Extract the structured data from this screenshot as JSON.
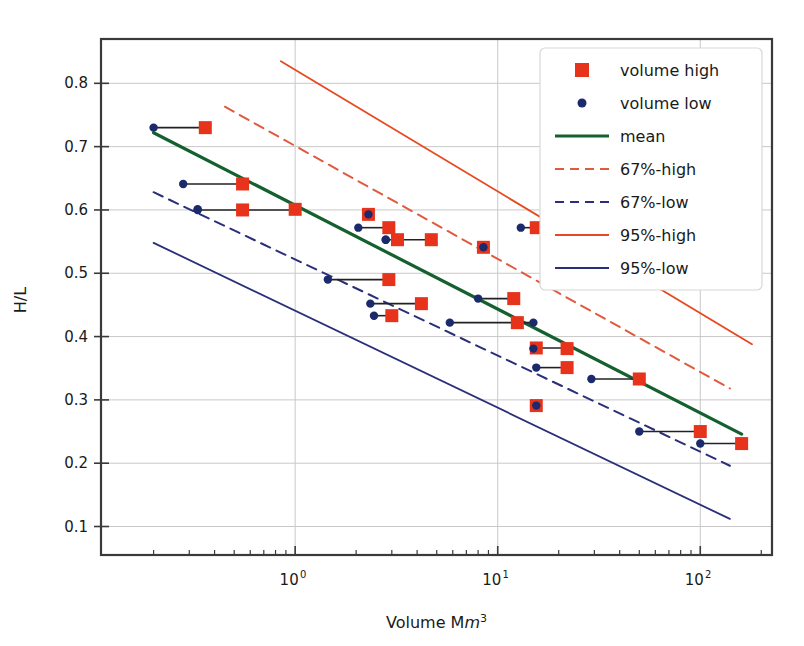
{
  "figure": {
    "title": "",
    "y_axis_label": "H/L",
    "x_axis_label_parts": {
      "prefix": "Volume M",
      "italic": "m",
      "superscript": "3"
    },
    "x_tick_labels": [
      "10",
      "10",
      "10"
    ],
    "x_tick_exponents": [
      "0",
      "1",
      "2"
    ],
    "y_tick_labels": [
      "0.8",
      "0.7",
      "0.6",
      "0.5",
      "0.4",
      "0.3",
      "0.2",
      "0.1"
    ]
  },
  "colors": {
    "volume_high": "#e8331c",
    "volume_low": "#1b2a6b",
    "mean": "#14602e",
    "p67_high": "#e05a3e",
    "p67_low": "#2a2f7a",
    "p95_high": "#e8481f",
    "p95_low": "#2a2f7a",
    "connector": "#222222",
    "grid": "#c8c8c8",
    "spine": "#3a3a3a",
    "background": "#ffffff",
    "legend_face": "#ffffff",
    "legend_edge": "#d8d8d8"
  },
  "legend": {
    "position": "upper right",
    "entries": [
      {
        "label": "volume high",
        "marker": "square",
        "color": "#e8331c"
      },
      {
        "label": "volume low",
        "marker": "dot",
        "color": "#1b2a6b"
      },
      {
        "label": "mean",
        "marker": "line",
        "color": "#14602e",
        "dash": "solid",
        "width": 3.2
      },
      {
        "label": "67%-high",
        "marker": "line",
        "color": "#e05a3e",
        "dash": "dashed",
        "width": 2.0
      },
      {
        "label": "67%-low",
        "marker": "line",
        "color": "#2a2f7a",
        "dash": "dashed",
        "width": 2.0
      },
      {
        "label": "95%-high",
        "marker": "line",
        "color": "#e8481f",
        "dash": "solid",
        "width": 1.8
      },
      {
        "label": "95%-low",
        "marker": "line",
        "color": "#2a2f7a",
        "dash": "solid",
        "width": 1.8
      }
    ]
  },
  "chart_data": {
    "type": "scatter",
    "title": "",
    "xlabel": "Volume Mm3",
    "ylabel": "H/L",
    "xscale": "log",
    "yscale": "linear",
    "xlim": [
      0.11,
      226
    ],
    "ylim": [
      0.055,
      0.87
    ],
    "grid": true,
    "xticks": [
      1,
      10,
      100
    ],
    "yticks": [
      0.1,
      0.2,
      0.3,
      0.4,
      0.5,
      0.6,
      0.7,
      0.8
    ],
    "series": [
      {
        "name": "volume high",
        "marker": "square",
        "color": "#e8331c",
        "x": [
          0.36,
          0.55,
          0.55,
          1.0,
          2.3,
          2.9,
          3.2,
          4.7,
          15.5,
          8.5,
          2.9,
          4.2,
          12.0,
          3.0,
          12.5,
          15.5,
          22.0,
          22.0,
          50.0,
          15.5,
          100.0,
          160.0
        ],
        "y": [
          0.73,
          0.641,
          0.6,
          0.601,
          0.593,
          0.572,
          0.553,
          0.553,
          0.572,
          0.541,
          0.49,
          0.452,
          0.46,
          0.433,
          0.422,
          0.382,
          0.381,
          0.351,
          0.333,
          0.291,
          0.25,
          0.231
        ]
      },
      {
        "name": "volume low",
        "marker": "dot",
        "color": "#1b2a6b",
        "x": [
          0.2,
          0.28,
          0.33,
          0.33,
          2.3,
          2.05,
          2.8,
          2.8,
          13.0,
          8.5,
          1.45,
          2.35,
          8.0,
          2.45,
          5.8,
          15.0,
          15.0,
          15.5,
          29.0,
          15.5,
          50.0,
          100.0
        ],
        "y": [
          0.73,
          0.641,
          0.6,
          0.601,
          0.593,
          0.572,
          0.553,
          0.553,
          0.572,
          0.541,
          0.49,
          0.452,
          0.46,
          0.433,
          0.422,
          0.422,
          0.381,
          0.351,
          0.333,
          0.291,
          0.25,
          0.231
        ]
      }
    ],
    "connectors": [
      {
        "y": 0.73,
        "x_low": 0.2,
        "x_high": 0.36
      },
      {
        "y": 0.641,
        "x_low": 0.28,
        "x_high": 0.55
      },
      {
        "y": 0.6,
        "x_low": 0.33,
        "x_high": 1.0
      },
      {
        "y": 0.593,
        "x_low": 2.3,
        "x_high": 2.3
      },
      {
        "y": 0.572,
        "x_low": 2.05,
        "x_high": 2.9
      },
      {
        "y": 0.553,
        "x_low": 2.8,
        "x_high": 4.7
      },
      {
        "y": 0.572,
        "x_low": 13.0,
        "x_high": 15.5
      },
      {
        "y": 0.541,
        "x_low": 8.5,
        "x_high": 8.5
      },
      {
        "y": 0.49,
        "x_low": 1.45,
        "x_high": 2.9
      },
      {
        "y": 0.452,
        "x_low": 2.35,
        "x_high": 4.2
      },
      {
        "y": 0.46,
        "x_low": 8.0,
        "x_high": 12.0
      },
      {
        "y": 0.433,
        "x_low": 2.45,
        "x_high": 3.0
      },
      {
        "y": 0.422,
        "x_low": 5.8,
        "x_high": 15.5
      },
      {
        "y": 0.382,
        "x_low": 15.0,
        "x_high": 22.0
      },
      {
        "y": 0.351,
        "x_low": 15.5,
        "x_high": 22.0
      },
      {
        "y": 0.333,
        "x_low": 29.0,
        "x_high": 50.0
      },
      {
        "y": 0.291,
        "x_low": 15.5,
        "x_high": 15.5
      },
      {
        "y": 0.25,
        "x_low": 50.0,
        "x_high": 100.0
      },
      {
        "y": 0.231,
        "x_low": 100.0,
        "x_high": 160.0
      }
    ],
    "lines": [
      {
        "name": "mean",
        "color": "#14602e",
        "dash": "solid",
        "width": 3.2,
        "x": [
          0.2,
          160.0
        ],
        "y": [
          0.722,
          0.246
        ]
      },
      {
        "name": "67%-high",
        "color": "#e05a3e",
        "dash": "dashed",
        "width": 2.0,
        "x": [
          0.45,
          140.0
        ],
        "y": [
          0.763,
          0.318
        ]
      },
      {
        "name": "67%-low",
        "color": "#2a2f7a",
        "dash": "dashed",
        "width": 2.0,
        "x": [
          0.2,
          140.0
        ],
        "y": [
          0.628,
          0.196
        ]
      },
      {
        "name": "95%-high",
        "color": "#e8481f",
        "dash": "solid",
        "width": 1.8,
        "x": [
          0.85,
          180.0
        ],
        "y": [
          0.835,
          0.388
        ]
      },
      {
        "name": "95%-low",
        "color": "#2a2f7a",
        "dash": "solid",
        "width": 1.8,
        "x": [
          0.2,
          140.0
        ],
        "y": [
          0.548,
          0.112
        ]
      }
    ]
  }
}
